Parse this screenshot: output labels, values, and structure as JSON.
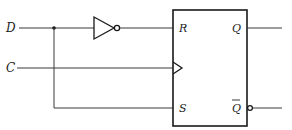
{
  "diagram": {
    "type": "circuit",
    "inputs": [
      {
        "name": "D",
        "label": "D"
      },
      {
        "name": "C",
        "label": "C"
      }
    ],
    "gates": [
      {
        "type": "inverter",
        "input": "D",
        "output": "R"
      }
    ],
    "flip_flop": {
      "type": "clocked-RS",
      "ports": {
        "R": "R",
        "S": "S",
        "Q": "Q",
        "Q_bar": "Q",
        "clock": "C"
      }
    },
    "connections": [
      {
        "from": "D",
        "to": "inverter.in"
      },
      {
        "from": "inverter.out",
        "to": "R"
      },
      {
        "from": "D",
        "to": "S"
      },
      {
        "from": "C",
        "to": "clock"
      },
      {
        "from": "Q",
        "to": "output"
      },
      {
        "from": "Q_bar",
        "to": "output"
      }
    ]
  }
}
